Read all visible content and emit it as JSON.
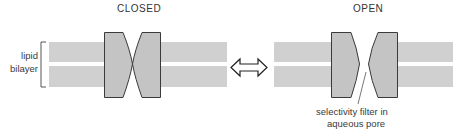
{
  "diagram": {
    "closed_state": {
      "title": "CLOSED"
    },
    "open_state": {
      "title": "OPEN"
    },
    "bilayer_label": {
      "line1": "lipid",
      "line2": "bilayer"
    },
    "pore_annotation": {
      "line1": "selectivity filter in",
      "line2": "aqueous pore"
    },
    "transition_arrow": "double-headed-arrow",
    "colors": {
      "membrane": "#d0d0d0",
      "channel_fill": "#c4c4c4",
      "channel_stroke": "#3a3a3a",
      "text": "#333333"
    }
  }
}
